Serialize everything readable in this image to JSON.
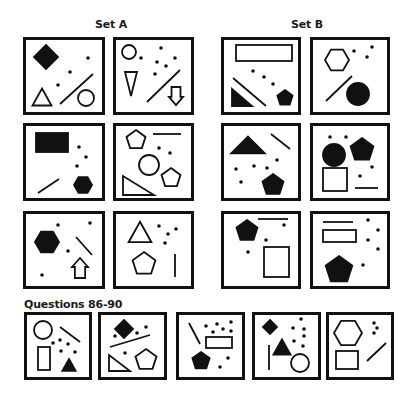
{
  "labels": {
    "set_a": "Set A",
    "set_b": "Set B",
    "questions": "Questions 86-90"
  },
  "colors": {
    "ink": "#111111",
    "background": "#ffffff"
  },
  "panels": [
    {
      "id": "A1",
      "group": "set_a",
      "x": 23,
      "y": 37,
      "w": 82,
      "h": 78,
      "shapes": [
        {
          "t": "diamond",
          "cx": 46,
          "cy": 57,
          "r": 12,
          "fill": true
        },
        {
          "t": "dot",
          "cx": 88,
          "cy": 58
        },
        {
          "t": "dot",
          "cx": 70,
          "cy": 72
        },
        {
          "t": "dot",
          "cx": 58,
          "cy": 85
        },
        {
          "t": "triangle",
          "cx": 42,
          "cy": 97,
          "r": 10,
          "fill": false
        },
        {
          "t": "line",
          "x1": 60,
          "y1": 104,
          "x2": 93,
          "y2": 74
        },
        {
          "t": "circle",
          "cx": 86,
          "cy": 98,
          "r": 8,
          "fill": false
        }
      ]
    },
    {
      "id": "A2",
      "group": "set_a",
      "x": 113,
      "y": 37,
      "w": 81,
      "h": 78,
      "shapes": [
        {
          "t": "circle",
          "cx": 129,
          "cy": 52,
          "r": 7,
          "fill": false
        },
        {
          "t": "dot",
          "cx": 141,
          "cy": 58
        },
        {
          "t": "dot",
          "cx": 161,
          "cy": 48
        },
        {
          "t": "dot",
          "cx": 157,
          "cy": 62
        },
        {
          "t": "dot",
          "cx": 166,
          "cy": 66
        },
        {
          "t": "dot",
          "cx": 175,
          "cy": 58
        },
        {
          "t": "dot",
          "cx": 155,
          "cy": 74
        },
        {
          "t": "vtriangle",
          "cx": 131,
          "cy": 84,
          "w": 12,
          "h": 24
        },
        {
          "t": "line",
          "x1": 147,
          "y1": 102,
          "x2": 180,
          "y2": 70
        },
        {
          "t": "arrowdown",
          "cx": 176,
          "cy": 96,
          "w": 14,
          "h": 18
        }
      ]
    },
    {
      "id": "B1",
      "group": "set_b",
      "x": 221,
      "y": 37,
      "w": 80,
      "h": 78,
      "shapes": [
        {
          "t": "rect",
          "x": 236,
          "y": 45,
          "w": 56,
          "h": 16,
          "fill": false
        },
        {
          "t": "dot",
          "cx": 253,
          "cy": 71
        },
        {
          "t": "dot",
          "cx": 264,
          "cy": 77
        },
        {
          "t": "dot",
          "cx": 273,
          "cy": 84
        },
        {
          "t": "rtriangle",
          "x": 232,
          "y": 89,
          "w": 20,
          "h": 17,
          "fill": true
        },
        {
          "t": "line",
          "x1": 233,
          "y1": 78,
          "x2": 266,
          "y2": 106
        },
        {
          "t": "pentagon",
          "cx": 285,
          "cy": 98,
          "r": 8,
          "fill": true
        }
      ]
    },
    {
      "id": "B2",
      "group": "set_b",
      "x": 310,
      "y": 37,
      "w": 80,
      "h": 78,
      "shapes": [
        {
          "t": "hexagon",
          "cx": 337,
          "cy": 60,
          "r": 12,
          "fill": false
        },
        {
          "t": "dot",
          "cx": 354,
          "cy": 51
        },
        {
          "t": "dot",
          "cx": 372,
          "cy": 47
        },
        {
          "t": "dot",
          "cx": 367,
          "cy": 57
        },
        {
          "t": "line",
          "x1": 326,
          "y1": 101,
          "x2": 352,
          "y2": 76
        },
        {
          "t": "circle",
          "cx": 358,
          "cy": 94,
          "r": 11,
          "fill": true
        }
      ]
    },
    {
      "id": "A3",
      "group": "set_a",
      "x": 23,
      "y": 123,
      "w": 82,
      "h": 78,
      "shapes": [
        {
          "t": "rect",
          "x": 36,
          "y": 133,
          "w": 32,
          "h": 19,
          "fill": true
        },
        {
          "t": "dot",
          "cx": 79,
          "cy": 147
        },
        {
          "t": "dot",
          "cx": 86,
          "cy": 157
        },
        {
          "t": "dot",
          "cx": 77,
          "cy": 166
        },
        {
          "t": "line",
          "x1": 38,
          "y1": 193,
          "x2": 59,
          "y2": 179
        },
        {
          "t": "hexagon",
          "cx": 83,
          "cy": 185,
          "r": 9,
          "fill": true
        }
      ]
    },
    {
      "id": "A4",
      "group": "set_a",
      "x": 113,
      "y": 123,
      "w": 81,
      "h": 78,
      "shapes": [
        {
          "t": "pentagon",
          "cx": 136,
          "cy": 140,
          "r": 10,
          "fill": false
        },
        {
          "t": "line",
          "x1": 153,
          "y1": 134,
          "x2": 181,
          "y2": 134
        },
        {
          "t": "dot",
          "cx": 159,
          "cy": 148
        },
        {
          "t": "dot",
          "cx": 170,
          "cy": 153
        },
        {
          "t": "circle",
          "cx": 149,
          "cy": 165,
          "r": 10,
          "fill": false
        },
        {
          "t": "pentagon",
          "cx": 171,
          "cy": 178,
          "r": 10,
          "fill": false
        },
        {
          "t": "rtriangle",
          "x": 123,
          "y": 176,
          "w": 31,
          "h": 19,
          "fill": false
        }
      ]
    },
    {
      "id": "B3",
      "group": "set_b",
      "x": 221,
      "y": 123,
      "w": 80,
      "h": 78,
      "shapes": [
        {
          "t": "triangle",
          "cx": 248,
          "cy": 145,
          "r": 12,
          "fill": true,
          "wide": true
        },
        {
          "t": "line",
          "x1": 271,
          "y1": 134,
          "x2": 290,
          "y2": 149
        },
        {
          "t": "dot",
          "cx": 236,
          "cy": 169
        },
        {
          "t": "dot",
          "cx": 254,
          "cy": 166
        },
        {
          "t": "dot",
          "cx": 267,
          "cy": 168
        },
        {
          "t": "dot",
          "cx": 277,
          "cy": 160
        },
        {
          "t": "dot",
          "cx": 241,
          "cy": 182
        },
        {
          "t": "pentagon",
          "cx": 273,
          "cy": 185,
          "r": 11,
          "fill": true
        }
      ]
    },
    {
      "id": "B4",
      "group": "set_b",
      "x": 310,
      "y": 123,
      "w": 80,
      "h": 78,
      "shapes": [
        {
          "t": "dot",
          "cx": 330,
          "cy": 137
        },
        {
          "t": "dot",
          "cx": 346,
          "cy": 137
        },
        {
          "t": "circle",
          "cx": 334,
          "cy": 155,
          "r": 11,
          "fill": true
        },
        {
          "t": "pentagon",
          "cx": 362,
          "cy": 150,
          "r": 12,
          "fill": true
        },
        {
          "t": "rect",
          "x": 323,
          "y": 168,
          "w": 24,
          "h": 23,
          "fill": false
        },
        {
          "t": "dot",
          "cx": 360,
          "cy": 176
        },
        {
          "t": "dot",
          "cx": 372,
          "cy": 167
        },
        {
          "t": "line",
          "x1": 355,
          "y1": 188,
          "x2": 378,
          "y2": 188
        }
      ]
    },
    {
      "id": "A5",
      "group": "set_a",
      "x": 23,
      "y": 211,
      "w": 82,
      "h": 78,
      "shapes": [
        {
          "t": "dot",
          "cx": 58,
          "cy": 225
        },
        {
          "t": "dot",
          "cx": 90,
          "cy": 223
        },
        {
          "t": "hexagon",
          "cx": 47,
          "cy": 242,
          "r": 12,
          "fill": true
        },
        {
          "t": "line",
          "x1": 76,
          "y1": 237,
          "x2": 92,
          "y2": 255
        },
        {
          "t": "dot",
          "cx": 68,
          "cy": 251
        },
        {
          "t": "arrowup",
          "cx": 80,
          "cy": 268,
          "w": 16,
          "h": 20
        },
        {
          "t": "dot",
          "cx": 42,
          "cy": 275
        }
      ]
    },
    {
      "id": "A6",
      "group": "set_a",
      "x": 113,
      "y": 211,
      "w": 81,
      "h": 78,
      "shapes": [
        {
          "t": "triangle",
          "cx": 140,
          "cy": 232,
          "r": 12,
          "fill": false
        },
        {
          "t": "dot",
          "cx": 159,
          "cy": 226
        },
        {
          "t": "dot",
          "cx": 168,
          "cy": 234
        },
        {
          "t": "dot",
          "cx": 176,
          "cy": 229
        },
        {
          "t": "dot",
          "cx": 165,
          "cy": 243
        },
        {
          "t": "pentagon",
          "cx": 144,
          "cy": 264,
          "r": 12,
          "fill": false
        },
        {
          "t": "line",
          "x1": 175,
          "y1": 254,
          "x2": 175,
          "y2": 277
        }
      ]
    },
    {
      "id": "B5",
      "group": "set_b",
      "x": 221,
      "y": 211,
      "w": 80,
      "h": 78,
      "shapes": [
        {
          "t": "pentagon",
          "cx": 247,
          "cy": 231,
          "r": 11,
          "fill": true
        },
        {
          "t": "line",
          "x1": 258,
          "y1": 219,
          "x2": 288,
          "y2": 219
        },
        {
          "t": "dot",
          "cx": 284,
          "cy": 225
        },
        {
          "t": "dot",
          "cx": 266,
          "cy": 240
        },
        {
          "t": "dot",
          "cx": 248,
          "cy": 252
        },
        {
          "t": "rect",
          "x": 264,
          "y": 247,
          "w": 25,
          "h": 30,
          "fill": false
        }
      ]
    },
    {
      "id": "B6",
      "group": "set_b",
      "x": 310,
      "y": 211,
      "w": 80,
      "h": 78,
      "shapes": [
        {
          "t": "line",
          "x1": 323,
          "y1": 222,
          "x2": 353,
          "y2": 222
        },
        {
          "t": "dot",
          "cx": 368,
          "cy": 220
        },
        {
          "t": "dot",
          "cx": 378,
          "cy": 230
        },
        {
          "t": "dot",
          "cx": 368,
          "cy": 240
        },
        {
          "t": "dot",
          "cx": 378,
          "cy": 249
        },
        {
          "t": "rect",
          "x": 323,
          "y": 230,
          "w": 33,
          "h": 12,
          "fill": false
        },
        {
          "t": "pentagon",
          "cx": 339,
          "cy": 270,
          "r": 14,
          "fill": true
        },
        {
          "t": "dot",
          "cx": 363,
          "cy": 265
        }
      ]
    },
    {
      "id": "Q86",
      "group": "questions",
      "x": 24,
      "y": 312,
      "w": 68,
      "h": 68,
      "shapes": [
        {
          "t": "circle",
          "cx": 43,
          "cy": 330,
          "r": 9,
          "fill": false
        },
        {
          "t": "line",
          "x1": 60,
          "y1": 327,
          "x2": 80,
          "y2": 342
        },
        {
          "t": "dot",
          "cx": 53,
          "cy": 343
        },
        {
          "t": "dot",
          "cx": 60,
          "cy": 340
        },
        {
          "t": "dot",
          "cx": 68,
          "cy": 344
        },
        {
          "t": "dot",
          "cx": 61,
          "cy": 351
        },
        {
          "t": "dot",
          "cx": 75,
          "cy": 352
        },
        {
          "t": "rect",
          "x": 38,
          "y": 347,
          "w": 12,
          "h": 23,
          "fill": false
        },
        {
          "t": "triangle",
          "cx": 69,
          "cy": 365,
          "r": 7,
          "fill": true
        }
      ]
    },
    {
      "id": "Q87",
      "group": "questions",
      "x": 98,
      "y": 312,
      "w": 69,
      "h": 68,
      "shapes": [
        {
          "t": "diamond",
          "cx": 124,
          "cy": 329,
          "r": 9,
          "fill": true
        },
        {
          "t": "dot",
          "cx": 115,
          "cy": 336
        },
        {
          "t": "dot",
          "cx": 137,
          "cy": 333
        },
        {
          "t": "dot",
          "cx": 146,
          "cy": 327
        },
        {
          "t": "line",
          "x1": 110,
          "y1": 347,
          "x2": 150,
          "y2": 335
        },
        {
          "t": "dot",
          "cx": 125,
          "cy": 353
        },
        {
          "t": "rtriangle",
          "x": 109,
          "y": 355,
          "w": 21,
          "h": 16,
          "fill": false
        },
        {
          "t": "pentagon",
          "cx": 146,
          "cy": 360,
          "r": 11,
          "fill": false
        }
      ]
    },
    {
      "id": "Q88",
      "group": "questions",
      "x": 176,
      "y": 312,
      "w": 69,
      "h": 68,
      "shapes": [
        {
          "t": "line",
          "x1": 189,
          "y1": 323,
          "x2": 200,
          "y2": 344
        },
        {
          "t": "dot",
          "cx": 206,
          "cy": 326
        },
        {
          "t": "dot",
          "cx": 217,
          "cy": 324
        },
        {
          "t": "dot",
          "cx": 231,
          "cy": 322
        },
        {
          "t": "dot",
          "cx": 213,
          "cy": 332
        },
        {
          "t": "dot",
          "cx": 223,
          "cy": 329
        },
        {
          "t": "dot",
          "cx": 231,
          "cy": 331
        },
        {
          "t": "rect",
          "x": 206,
          "y": 337,
          "w": 26,
          "h": 11,
          "fill": false
        },
        {
          "t": "pentagon",
          "cx": 201,
          "cy": 361,
          "r": 9,
          "fill": true
        },
        {
          "t": "dot",
          "cx": 228,
          "cy": 358
        },
        {
          "t": "dot",
          "cx": 220,
          "cy": 367
        }
      ]
    },
    {
      "id": "Q89",
      "group": "questions",
      "x": 252,
      "y": 312,
      "w": 69,
      "h": 68,
      "shapes": [
        {
          "t": "diamond",
          "cx": 270,
          "cy": 327,
          "r": 7,
          "fill": true
        },
        {
          "t": "dot",
          "cx": 301,
          "cy": 319
        },
        {
          "t": "dot",
          "cx": 293,
          "cy": 328
        },
        {
          "t": "dot",
          "cx": 304,
          "cy": 329
        },
        {
          "t": "dot",
          "cx": 304,
          "cy": 336
        },
        {
          "t": "dot",
          "cx": 294,
          "cy": 341
        },
        {
          "t": "dot",
          "cx": 303,
          "cy": 346
        },
        {
          "t": "line",
          "x1": 269,
          "y1": 345,
          "x2": 269,
          "y2": 370
        },
        {
          "t": "triangle",
          "cx": 282,
          "cy": 347,
          "r": 9,
          "fill": true
        },
        {
          "t": "circle",
          "cx": 300,
          "cy": 363,
          "r": 9,
          "fill": false
        }
      ]
    },
    {
      "id": "Q90",
      "group": "questions",
      "x": 326,
      "y": 312,
      "w": 68,
      "h": 68,
      "shapes": [
        {
          "t": "hexagon",
          "cx": 348,
          "cy": 333,
          "r": 14,
          "fill": false
        },
        {
          "t": "dot",
          "cx": 374,
          "cy": 323
        },
        {
          "t": "dot",
          "cx": 377,
          "cy": 328
        },
        {
          "t": "dot",
          "cx": 374,
          "cy": 333
        },
        {
          "t": "rect",
          "x": 336,
          "y": 351,
          "w": 22,
          "h": 18,
          "fill": false
        },
        {
          "t": "line",
          "x1": 367,
          "y1": 361,
          "x2": 386,
          "y2": 343
        }
      ]
    }
  ]
}
